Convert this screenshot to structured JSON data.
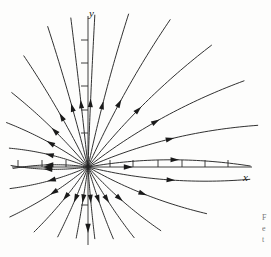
{
  "figure": {
    "kind": "phase-portrait",
    "background_color": "#fdfdfc",
    "stroke_color": "#1a1a1a",
    "axis_color": "#2a2a2a",
    "width": 271,
    "height": 257
  },
  "axes": {
    "x_label": "x",
    "y_label": "y",
    "origin": {
      "x": 88,
      "y": 167
    },
    "x_axis": {
      "x_start": 12,
      "x_end": 252,
      "y": 167
    },
    "y_axis": {
      "x": 88,
      "y_start": 16,
      "y_end": 245
    },
    "tick_length": 7,
    "x_ticks_positive": [
      110,
      133,
      158,
      182,
      205,
      228
    ],
    "x_ticks_negative": [
      66,
      42,
      18
    ],
    "y_ticks_positive": [
      40,
      63,
      86,
      110,
      133
    ],
    "y_ticks_negative": [
      205
    ],
    "x_axis_arrow": {
      "x": 128,
      "y": 167,
      "dir": "right"
    },
    "y_axis_arrow": {
      "x": 88,
      "y": 228,
      "dir": "down"
    }
  },
  "chart_data": {
    "type": "line",
    "title": "",
    "subtitle": "",
    "xlabel": "x",
    "ylabel": "y",
    "grid": false,
    "legend": "none",
    "equilibrium": {
      "x": 0,
      "y": 0,
      "classification": "unstable node",
      "flow": "outward"
    },
    "xlim": [
      -3.2,
      7.0
    ],
    "ylim": [
      -3.5,
      6.6
    ],
    "trajectories": [
      {
        "id": "t1",
        "angle_deg": 88,
        "arrow_t": 0.42,
        "flare": 0.02,
        "length": 152
      },
      {
        "id": "t2",
        "angle_deg": 78,
        "arrow_t": 0.4,
        "flare": 0.1,
        "length": 158
      },
      {
        "id": "t3",
        "angle_deg": 66,
        "arrow_t": 0.42,
        "flare": 0.18,
        "length": 168
      },
      {
        "id": "t4",
        "angle_deg": 52,
        "arrow_t": 0.44,
        "flare": 0.26,
        "length": 172
      },
      {
        "id": "t5",
        "angle_deg": 38,
        "arrow_t": 0.46,
        "flare": 0.32,
        "length": 176
      },
      {
        "id": "t6",
        "angle_deg": 24,
        "arrow_t": 0.5,
        "flare": 0.36,
        "length": 172
      },
      {
        "id": "t7",
        "angle_deg": 10,
        "arrow_t": 0.54,
        "flare": 0.34,
        "length": 160
      },
      {
        "id": "t8",
        "angle_deg": -14,
        "arrow_t": 0.52,
        "flare": -0.34,
        "length": 160
      },
      {
        "id": "t9",
        "angle_deg": -30,
        "arrow_t": 0.48,
        "flare": -0.3,
        "length": 126
      },
      {
        "id": "t10",
        "angle_deg": -48,
        "arrow_t": 0.46,
        "flare": -0.24,
        "length": 96
      },
      {
        "id": "t11",
        "angle_deg": -62,
        "arrow_t": 0.44,
        "flare": -0.18,
        "length": 84
      },
      {
        "id": "t12",
        "angle_deg": -74,
        "arrow_t": 0.44,
        "flare": -0.12,
        "length": 76
      },
      {
        "id": "t13",
        "angle_deg": -86,
        "arrow_t": 0.44,
        "flare": -0.05,
        "length": 72
      },
      {
        "id": "t14",
        "angle_deg": -98,
        "arrow_t": 0.44,
        "flare": 0.05,
        "length": 72
      },
      {
        "id": "t15",
        "angle_deg": -110,
        "arrow_t": 0.44,
        "flare": 0.12,
        "length": 76
      },
      {
        "id": "t16",
        "angle_deg": -124,
        "arrow_t": 0.44,
        "flare": 0.2,
        "length": 84
      },
      {
        "id": "t17",
        "angle_deg": -140,
        "arrow_t": 0.46,
        "flare": 0.26,
        "length": 92
      },
      {
        "id": "t18",
        "angle_deg": -156,
        "arrow_t": 0.48,
        "flare": 0.3,
        "length": 80
      },
      {
        "id": "t19",
        "angle_deg": -172,
        "arrow_t": 0.52,
        "flare": 0.32,
        "length": 76
      },
      {
        "id": "t20",
        "angle_deg": 172,
        "arrow_t": 0.52,
        "flare": -0.32,
        "length": 74
      },
      {
        "id": "t21",
        "angle_deg": 158,
        "arrow_t": 0.5,
        "flare": -0.3,
        "length": 80
      },
      {
        "id": "t22",
        "angle_deg": 144,
        "arrow_t": 0.48,
        "flare": -0.26,
        "length": 92
      },
      {
        "id": "t23",
        "angle_deg": 130,
        "arrow_t": 0.46,
        "flare": -0.2,
        "length": 106
      },
      {
        "id": "t24",
        "angle_deg": 116,
        "arrow_t": 0.44,
        "flare": -0.14,
        "length": 128
      },
      {
        "id": "t25",
        "angle_deg": 104,
        "arrow_t": 0.42,
        "flare": -0.07,
        "length": 146
      },
      {
        "id": "t26",
        "angle_deg": 96,
        "arrow_t": 0.42,
        "flare": -0.02,
        "length": 150
      }
    ],
    "axis_flow_arrows": [
      {
        "on": "x-axis-positive",
        "x": 128,
        "y": 167,
        "dir": "right"
      },
      {
        "on": "x-axis-negative",
        "x": 48,
        "y": 167,
        "dir": "left"
      },
      {
        "on": "y-axis-negative",
        "x": 88,
        "y": 228,
        "dir": "down"
      }
    ]
  },
  "caption": {
    "clipped_lines": [
      "F",
      "e",
      "t"
    ]
  }
}
